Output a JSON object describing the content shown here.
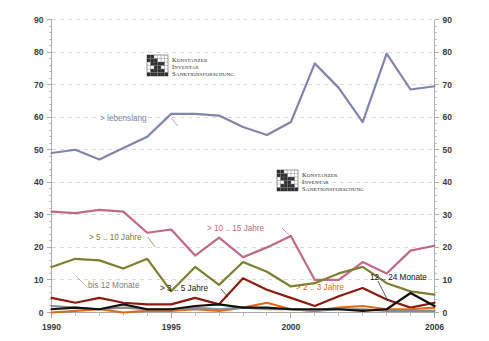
{
  "chart_data": {
    "type": "line",
    "title": "",
    "subtitle": "",
    "xlabel": "",
    "ylabel": "",
    "xlim": [
      1990,
      2006
    ],
    "ylim": [
      0,
      90
    ],
    "grid": true,
    "legend_position": "inline-annotations",
    "y_ticks": [
      0,
      10,
      20,
      30,
      40,
      50,
      60,
      70,
      80,
      90
    ],
    "y_ticks_right": [
      0,
      10,
      20,
      30,
      40,
      50,
      60,
      70,
      80,
      90
    ],
    "x_tick_labels": [
      "1990",
      "1995",
      "2000",
      "2006"
    ],
    "x_tick_values": [
      1990,
      1995,
      2000,
      2006
    ],
    "x": [
      1990,
      1991,
      1992,
      1993,
      1994,
      1995,
      1996,
      1997,
      1998,
      1999,
      2000,
      2001,
      2002,
      2003,
      2004,
      2005,
      2006
    ],
    "series": [
      {
        "name": "> lebenslang",
        "color": "#8185ab",
        "label_color": "#8185ab",
        "values": [
          49,
          50,
          47,
          50.5,
          54,
          61,
          61,
          60.5,
          57,
          54.5,
          58.5,
          76.5,
          69,
          58.5,
          79.5,
          68.5,
          69.5
        ]
      },
      {
        "name": "> 10 .. 15 Jahre",
        "color": "#c4688a",
        "label_color": "#c4688a",
        "values": [
          31,
          30.5,
          31.5,
          31,
          24.5,
          25.5,
          17.5,
          23,
          17,
          20,
          23.5,
          10,
          10,
          15.5,
          12,
          19,
          20.5
        ]
      },
      {
        "name": "> 5 .. 10 Jahre",
        "color": "#7d8030",
        "label_color": "#7d8030",
        "values": [
          14,
          16.5,
          16,
          13.5,
          16.5,
          6.5,
          14,
          8.5,
          15.5,
          12.5,
          8,
          9,
          12,
          14,
          9,
          6.5,
          5.5
        ]
      },
      {
        "name": "> 3 .. 5 Jahre",
        "color": "#8b1d10",
        "label_color": "#1a1a1a",
        "values": [
          4.5,
          3,
          4.5,
          3,
          2.5,
          2.5,
          4.5,
          2.5,
          10.5,
          7,
          4.5,
          2,
          5,
          7.5,
          4,
          1.5,
          3
        ]
      },
      {
        "name": "> 2 .. 3 Jahre",
        "color": "#e06a16",
        "label_color": "#e06a16",
        "values": [
          0,
          0.5,
          1,
          0,
          0.5,
          0.5,
          1,
          0.5,
          1.5,
          3,
          1,
          0.5,
          1.5,
          2,
          1,
          1,
          1.5
        ]
      },
      {
        "name": "12 .. 24 Monate",
        "color": "#111111",
        "label_color": "#111111",
        "values": [
          1,
          1.5,
          1,
          2.5,
          1,
          1,
          2,
          2.5,
          1.5,
          1.5,
          1,
          1,
          1,
          0.5,
          1,
          6,
          2
        ]
      },
      {
        "name": "bis  12 Monate",
        "color": "#8c8c8c",
        "label_color": "#8c8c8c",
        "values": [
          2,
          1.5,
          1,
          1.5,
          1,
          1,
          1.5,
          1,
          1.5,
          1,
          1,
          0.5,
          1,
          1,
          0.5,
          0.5,
          0.5
        ]
      }
    ],
    "annotations": [
      {
        "text": "> lebenslang",
        "series": "> lebenslang",
        "x": 100,
        "y": 121,
        "color": "#8185ab"
      },
      {
        "text": "> 10 .. 15 Jahre",
        "series": "> 10 .. 15 Jahre",
        "x": 207,
        "y": 231,
        "color": "#c4688a"
      },
      {
        "text": "> 5 .. 10 Jahre",
        "series": "> 5 .. 10 Jahre",
        "x": 89,
        "y": 240,
        "color": "#7d8030"
      },
      {
        "text": "bis  12 Monate",
        "series": "bis  12 Monate",
        "x": 88,
        "y": 288,
        "color": "#7d7d7d"
      },
      {
        "text": "> 3 .. 5 Jahre",
        "series": "> 3 .. 5 Jahre",
        "x": 160,
        "y": 291,
        "color": "#1a1a1a"
      },
      {
        "text": "> 2 .. 3 Jahre",
        "series": "> 2 .. 3 Jahre",
        "x": 296,
        "y": 290,
        "color": "#e06a16"
      },
      {
        "text": "12 .. 24 Monate",
        "series": "12 .. 24 Monate",
        "x": 370,
        "y": 280,
        "color": "#111111"
      }
    ]
  },
  "watermarks": [
    {
      "line1": "Konstanzer",
      "line2": "Inventar",
      "line3": "Sanktionsforschung",
      "x": 147,
      "y": 55
    },
    {
      "line1": "Konstanzer",
      "line2": "Inventar",
      "line3": "Sanktionsforschung",
      "x": 277,
      "y": 170
    }
  ],
  "colors": {
    "background": "#ffffff",
    "gridline": "#c9c9d6",
    "axis": "#9a9a9a",
    "tick_text": "#3a3a3a"
  }
}
